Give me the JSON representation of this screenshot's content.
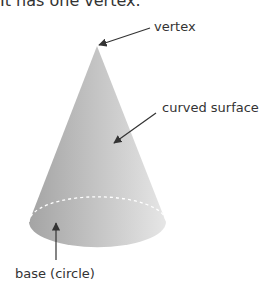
{
  "caption": "It has one vertex.",
  "labels": {
    "vertex": "vertex",
    "curved_surface": "curved surface",
    "base": "base (circle)"
  },
  "colors": {
    "cone_dark": "#a6a6a6",
    "cone_light": "#e2e2e2",
    "text": "#333333",
    "arrow": "#333333",
    "dashed_edge": "#ffffff"
  }
}
